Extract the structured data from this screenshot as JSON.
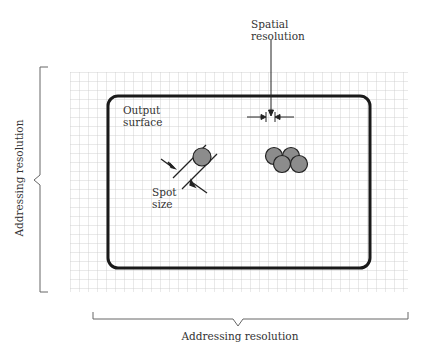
{
  "diagram": {
    "labels": {
      "spatial_resolution_line1": "Spatial",
      "spatial_resolution_line2": "resolution",
      "output_surface_line1": "Output",
      "output_surface_line2": "surface",
      "spot_size_line1": "Spot",
      "spot_size_line2": "size",
      "addressing_resolution_vertical": "Addressing resolution",
      "addressing_resolution_horizontal": "Addressing resolution"
    },
    "colors": {
      "grid": "#c8c8c8",
      "surface_border": "#1a1a1a",
      "spot_fill": "#8c8c8c",
      "spot_stroke": "#222222",
      "brace": "#666666"
    },
    "grid": {
      "x": 70,
      "y": 72,
      "width": 338,
      "height": 220,
      "spacing": 9
    },
    "spot_cluster_count": 4
  }
}
